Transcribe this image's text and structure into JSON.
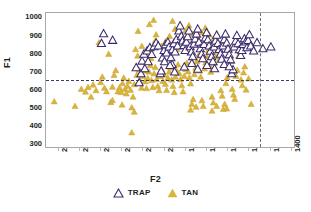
{
  "chart_data": {
    "type": "scatter",
    "title": "",
    "xlabel": "F2",
    "ylabel": "F1",
    "xlim": [
      2560,
      1380
    ],
    "ylim": [
      1030,
      280
    ],
    "x_axis_reversed": true,
    "y_axis_reversed": true,
    "grid": false,
    "legend_position": "bottom-center",
    "xticks": [
      2500,
      2400,
      2300,
      2200,
      2100,
      2000,
      1900,
      1800,
      1700,
      1600,
      1500,
      1400
    ],
    "yticks": [
      300,
      400,
      500,
      600,
      700,
      800,
      900,
      1000
    ],
    "reference_lines": [
      {
        "orientation": "horizontal",
        "value": 660,
        "style": "dashed",
        "color": "#3a3a6e"
      },
      {
        "orientation": "vertical",
        "value": 1550,
        "style": "dashed",
        "color": "#6b6b78"
      }
    ],
    "series": [
      {
        "name": "TRAP",
        "marker": "triangle-open",
        "color": "#ffffff",
        "edge_color": "#3b2a6b",
        "points": [
          [
            2296,
            860
          ],
          [
            2243,
            877
          ],
          [
            2286,
            914
          ],
          [
            2131,
            724
          ],
          [
            2117,
            640
          ],
          [
            2103,
            761
          ],
          [
            2094,
            800
          ],
          [
            2079,
            818
          ],
          [
            2066,
            836
          ],
          [
            2057,
            798
          ],
          [
            2046,
            842
          ],
          [
            2036,
            862
          ],
          [
            2026,
            846
          ],
          [
            2016,
            690
          ],
          [
            2012,
            706
          ],
          [
            2006,
            778
          ],
          [
            1998,
            820
          ],
          [
            1992,
            852
          ],
          [
            1986,
            806
          ],
          [
            1980,
            866
          ],
          [
            1974,
            840
          ],
          [
            1966,
            780
          ],
          [
            1958,
            824
          ],
          [
            1952,
            858
          ],
          [
            1946,
            812
          ],
          [
            1940,
            880
          ],
          [
            1934,
            846
          ],
          [
            1928,
            930
          ],
          [
            1922,
            958
          ],
          [
            1916,
            900
          ],
          [
            1910,
            874
          ],
          [
            1904,
            848
          ],
          [
            1898,
            820
          ],
          [
            1892,
            866
          ],
          [
            1886,
            898
          ],
          [
            1880,
            930
          ],
          [
            1874,
            842
          ],
          [
            1868,
            812
          ],
          [
            1862,
            786
          ],
          [
            1856,
            856
          ],
          [
            1850,
            884
          ],
          [
            1844,
            912
          ],
          [
            1838,
            940
          ],
          [
            1832,
            866
          ],
          [
            1826,
            830
          ],
          [
            1820,
            800
          ],
          [
            1814,
            774
          ],
          [
            1808,
            854
          ],
          [
            1802,
            890
          ],
          [
            1796,
            920
          ],
          [
            1790,
            880
          ],
          [
            1784,
            846
          ],
          [
            1778,
            816
          ],
          [
            1772,
            786
          ],
          [
            1766,
            758
          ],
          [
            1760,
            840
          ],
          [
            1754,
            874
          ],
          [
            1748,
            906
          ],
          [
            1742,
            860
          ],
          [
            1736,
            826
          ],
          [
            1730,
            800
          ],
          [
            1724,
            772
          ],
          [
            1718,
            846
          ],
          [
            1712,
            880
          ],
          [
            1706,
            912
          ],
          [
            1700,
            862
          ],
          [
            1694,
            828
          ],
          [
            1688,
            796
          ],
          [
            1682,
            768
          ],
          [
            1676,
            690
          ],
          [
            1670,
            712
          ],
          [
            1664,
            840
          ],
          [
            1658,
            872
          ],
          [
            1652,
            904
          ],
          [
            1646,
            858
          ],
          [
            1640,
            824
          ],
          [
            1634,
            792
          ],
          [
            1628,
            820
          ],
          [
            1622,
            854
          ],
          [
            1616,
            886
          ],
          [
            1610,
            868
          ],
          [
            1604,
            836
          ],
          [
            1598,
            876
          ],
          [
            1592,
            908
          ],
          [
            1586,
            846
          ],
          [
            1572,
            818
          ],
          [
            1556,
            864
          ],
          [
            1528,
            830
          ],
          [
            1490,
            840
          ],
          [
            1960,
            742
          ],
          [
            1948,
            700
          ],
          [
            1902,
            728
          ],
          [
            1866,
            748
          ],
          [
            1838,
            716
          ],
          [
            1794,
            736
          ],
          [
            1758,
            718
          ],
          [
            1712,
            742
          ],
          [
            1688,
            730
          ],
          [
            2108,
            690
          ],
          [
            2090,
            718
          ],
          [
            2074,
            758
          ],
          [
            1996,
            758
          ],
          [
            1970,
            736
          ]
        ]
      },
      {
        "name": "TAN",
        "marker": "triangle-filled",
        "color": "#d9b43c",
        "edge_color": "#c9a32e",
        "points": [
          [
            2521,
            534
          ],
          [
            2422,
            508
          ],
          [
            2392,
            604
          ],
          [
            2372,
            588
          ],
          [
            2360,
            614
          ],
          [
            2346,
            560
          ],
          [
            2336,
            628
          ],
          [
            2322,
            596
          ],
          [
            2308,
            864
          ],
          [
            2300,
            642
          ],
          [
            2292,
            672
          ],
          [
            2282,
            610
          ],
          [
            2272,
            590
          ],
          [
            2262,
            800
          ],
          [
            2252,
            530
          ],
          [
            2244,
            616
          ],
          [
            2236,
            682
          ],
          [
            2228,
            708
          ],
          [
            2218,
            590
          ],
          [
            2210,
            612
          ],
          [
            2202,
            586
          ],
          [
            2196,
            636
          ],
          [
            2190,
            666
          ],
          [
            2184,
            604
          ],
          [
            2178,
            578
          ],
          [
            2172,
            620
          ],
          [
            2166,
            648
          ],
          [
            2158,
            598
          ],
          [
            2152,
            360
          ],
          [
            2146,
            560
          ],
          [
            2140,
            630
          ],
          [
            2134,
            826
          ],
          [
            2128,
            682
          ],
          [
            2122,
            928
          ],
          [
            2118,
            712
          ],
          [
            2112,
            648
          ],
          [
            2106,
            610
          ],
          [
            2100,
            676
          ],
          [
            2094,
            706
          ],
          [
            2088,
            646
          ],
          [
            2082,
            608
          ],
          [
            2076,
            664
          ],
          [
            2070,
            700
          ],
          [
            2064,
            736
          ],
          [
            2058,
            652
          ],
          [
            2052,
            614
          ],
          [
            2046,
            690
          ],
          [
            2040,
            726
          ],
          [
            2034,
            658
          ],
          [
            2028,
            620
          ],
          [
            2022,
            596
          ],
          [
            2016,
            676
          ],
          [
            2010,
            712
          ],
          [
            2004,
            648
          ],
          [
            1998,
            684
          ],
          [
            1992,
            632
          ],
          [
            1986,
            598
          ],
          [
            1980,
            666
          ],
          [
            1974,
            700
          ],
          [
            1968,
            724
          ],
          [
            1962,
            656
          ],
          [
            1956,
            620
          ],
          [
            1950,
            586
          ],
          [
            1944,
            672
          ],
          [
            1938,
            706
          ],
          [
            1932,
            740
          ],
          [
            1926,
            692
          ],
          [
            1920,
            658
          ],
          [
            1914,
            624
          ],
          [
            1908,
            590
          ],
          [
            1902,
            676
          ],
          [
            1896,
            714
          ],
          [
            1890,
            750
          ],
          [
            1884,
            702
          ],
          [
            1878,
            668
          ],
          [
            1872,
            634
          ],
          [
            1866,
            520
          ],
          [
            1860,
            546
          ],
          [
            1854,
            686
          ],
          [
            1848,
            722
          ],
          [
            1842,
            758
          ],
          [
            1836,
            790
          ],
          [
            1830,
            706
          ],
          [
            1824,
            672
          ],
          [
            1818,
            540
          ],
          [
            1812,
            508
          ],
          [
            1806,
            718
          ],
          [
            1800,
            752
          ],
          [
            1794,
            786
          ],
          [
            1788,
            820
          ],
          [
            1782,
            736
          ],
          [
            1776,
            700
          ],
          [
            1770,
            560
          ],
          [
            1764,
            528
          ],
          [
            1758,
            752
          ],
          [
            1752,
            786
          ],
          [
            1746,
            818
          ],
          [
            1740,
            850
          ],
          [
            1734,
            770
          ],
          [
            1728,
            596
          ],
          [
            1722,
            566
          ],
          [
            1716,
            492
          ],
          [
            1710,
            520
          ],
          [
            1704,
            636
          ],
          [
            1698,
            668
          ],
          [
            1692,
            800
          ],
          [
            1686,
            832
          ],
          [
            1680,
            760
          ],
          [
            1674,
            604
          ],
          [
            1668,
            572
          ],
          [
            1662,
            548
          ],
          [
            1656,
            676
          ],
          [
            1650,
            710
          ],
          [
            1644,
            790
          ],
          [
            1638,
            822
          ],
          [
            1632,
            656
          ],
          [
            1626,
            624
          ],
          [
            1620,
            696
          ],
          [
            1614,
            730
          ],
          [
            1608,
            600
          ],
          [
            1596,
            662
          ],
          [
            1584,
            520
          ],
          [
            2068,
            966
          ],
          [
            2048,
            990
          ],
          [
            2036,
            908
          ],
          [
            1958,
            984
          ],
          [
            1946,
            940
          ],
          [
            1916,
            900
          ],
          [
            1896,
            930
          ],
          [
            1880,
            960
          ],
          [
            1862,
            912
          ],
          [
            1840,
            890
          ],
          [
            1820,
            920
          ],
          [
            1802,
            946
          ],
          [
            1784,
            908
          ],
          [
            1766,
            880
          ],
          [
            2010,
            846
          ],
          [
            1990,
            872
          ],
          [
            1972,
            900
          ],
          [
            1954,
            860
          ],
          [
            1936,
            826
          ],
          [
            2124,
            790
          ],
          [
            2104,
            844
          ],
          [
            2086,
            812
          ],
          [
            2060,
            776
          ],
          [
            2040,
            874
          ],
          [
            2152,
            500
          ],
          [
            2140,
            476
          ],
          [
            2244,
            540
          ],
          [
            2198,
            516
          ],
          [
            1872,
            488
          ],
          [
            1846,
            504
          ],
          [
            1770,
            482
          ],
          [
            1748,
            508
          ],
          [
            1700,
            494
          ]
        ]
      }
    ]
  },
  "legend": {
    "items": [
      {
        "label": "TRAP",
        "marker": "triangle-open"
      },
      {
        "label": "TAN",
        "marker": "triangle-filled"
      }
    ]
  },
  "colors": {
    "tan_fill": "#d9b43c",
    "trap_edge": "#3b2a6b",
    "trap_fill": "#ffffff",
    "frame": "#a8a8ac",
    "ref_h": "#3a3a6e",
    "ref_v": "#6b6b78",
    "text": "#231f20"
  }
}
